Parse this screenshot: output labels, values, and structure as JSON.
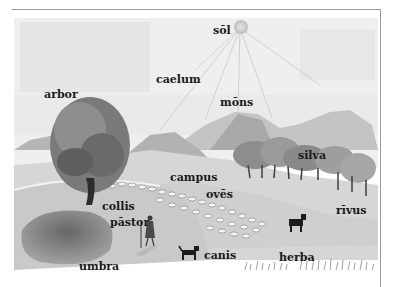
{
  "illustration": {
    "style": "grayscale pencil drawing",
    "colors": {
      "background": "#ffffff",
      "rule": "#9a9a9a",
      "label_text": "#1a1a1a",
      "sky": "#ececec",
      "hills": "#bdbdbd",
      "tree": "#6a6a6a",
      "shadow": "#7a7a7a"
    },
    "labels": [
      {
        "id": "sol",
        "text": "sōl",
        "x": 213,
        "y": 25
      },
      {
        "id": "caelum",
        "text": "caelum",
        "x": 156,
        "y": 74
      },
      {
        "id": "arbor",
        "text": "arbor",
        "x": 44,
        "y": 89
      },
      {
        "id": "mons",
        "text": "mōns",
        "x": 220,
        "y": 97
      },
      {
        "id": "silva",
        "text": "silva",
        "x": 298,
        "y": 150
      },
      {
        "id": "campus",
        "text": "campus",
        "x": 170,
        "y": 172
      },
      {
        "id": "oves",
        "text": "ovēs",
        "x": 206,
        "y": 189
      },
      {
        "id": "collis",
        "text": "collis",
        "x": 102,
        "y": 201
      },
      {
        "id": "rivus",
        "text": "rīvus",
        "x": 336,
        "y": 205
      },
      {
        "id": "pastor",
        "text": "pāstor",
        "x": 110,
        "y": 217
      },
      {
        "id": "canis",
        "text": "canis",
        "x": 204,
        "y": 250
      },
      {
        "id": "herba",
        "text": "herba",
        "x": 279,
        "y": 252
      },
      {
        "id": "umbra",
        "text": "umbra",
        "x": 79,
        "y": 261
      }
    ]
  }
}
